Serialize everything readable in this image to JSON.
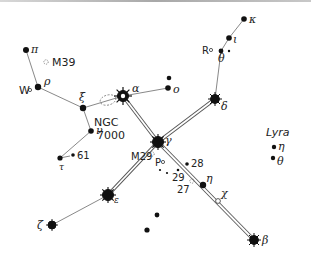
{
  "chart": {
    "constellation_label": "Lyra",
    "colors": {
      "star": "#1a1a1a",
      "line": "#6a6a6a",
      "background": "#ffffff",
      "topline": "#a8a8a8"
    },
    "stars": [
      {
        "id": "pi",
        "label": "π",
        "x": 26,
        "y": 50,
        "r": 3
      },
      {
        "id": "rho",
        "label": "ρ",
        "x": 38,
        "y": 87,
        "r": 3.2
      },
      {
        "id": "xi",
        "label": "ξ",
        "x": 83,
        "y": 108,
        "r": 3.2
      },
      {
        "id": "alpha",
        "label": "α",
        "x": 123,
        "y": 96,
        "r": 5,
        "major": true
      },
      {
        "id": "o1",
        "label": "o",
        "x": 168,
        "y": 88,
        "r": 2.8
      },
      {
        "id": "o2",
        "label": "",
        "x": 169,
        "y": 78,
        "r": 2.4
      },
      {
        "id": "kappa",
        "label": "κ",
        "x": 244,
        "y": 19,
        "r": 2.8
      },
      {
        "id": "iota",
        "label": "ι",
        "x": 229,
        "y": 38,
        "r": 2.8
      },
      {
        "id": "theta",
        "label": "θ",
        "x": 221,
        "y": 51,
        "r": 2.4
      },
      {
        "id": "delta",
        "label": "δ",
        "x": 215,
        "y": 99,
        "r": 4.2,
        "major": true
      },
      {
        "id": "nu",
        "label": "ν",
        "x": 91,
        "y": 131,
        "r": 2.8
      },
      {
        "id": "tau",
        "label": "τ",
        "x": 60,
        "y": 158,
        "r": 2.6
      },
      {
        "id": "s61",
        "label": "61",
        "x": 73,
        "y": 155,
        "r": 1.8
      },
      {
        "id": "gamma",
        "label": "γ",
        "x": 158,
        "y": 142,
        "r": 5,
        "major": true
      },
      {
        "id": "s28",
        "label": "28",
        "x": 187,
        "y": 164,
        "r": 1.8
      },
      {
        "id": "eta",
        "label": "η",
        "x": 203,
        "y": 185,
        "r": 3
      },
      {
        "id": "epsilon",
        "label": "ε",
        "x": 108,
        "y": 195,
        "r": 5,
        "major": true
      },
      {
        "id": "zeta",
        "label": "ζ",
        "x": 52,
        "y": 225,
        "r": 3.8,
        "major": true
      },
      {
        "id": "beta",
        "label": "β",
        "x": 254,
        "y": 240,
        "r": 4.2,
        "major": true
      },
      {
        "id": "u1",
        "label": "",
        "x": 157,
        "y": 215,
        "r": 2.4
      },
      {
        "id": "u2",
        "label": "",
        "x": 147,
        "y": 230,
        "r": 2.6
      },
      {
        "id": "lyra_eta",
        "label": "η",
        "x": 274,
        "y": 147,
        "r": 2.2
      },
      {
        "id": "lyra_theta",
        "label": "θ",
        "x": 273,
        "y": 158,
        "r": 2.2
      }
    ],
    "small_dots": [
      {
        "x": 229,
        "y": 51
      },
      {
        "x": 160,
        "y": 170
      },
      {
        "x": 167,
        "y": 173
      },
      {
        "x": 178,
        "y": 170
      }
    ],
    "variables": [
      {
        "label": "W",
        "x": 29,
        "y": 91
      },
      {
        "label": "R",
        "x": 211,
        "y": 51
      },
      {
        "label": "P",
        "x": 163,
        "y": 163
      },
      {
        "label": "χ",
        "x": 218,
        "y": 201
      }
    ],
    "clusters": [
      {
        "label": "M39",
        "x": 47,
        "y": 62
      },
      {
        "label": "M29",
        "x": 152,
        "y": 155
      },
      {
        "label": "27",
        "x": 192,
        "y": 181
      }
    ],
    "nebula": {
      "label_line1": "NGC",
      "label_line2": "7000",
      "x": 108,
      "y": 100
    },
    "numbered_labels": [
      "61",
      "28",
      "29",
      "27"
    ]
  }
}
